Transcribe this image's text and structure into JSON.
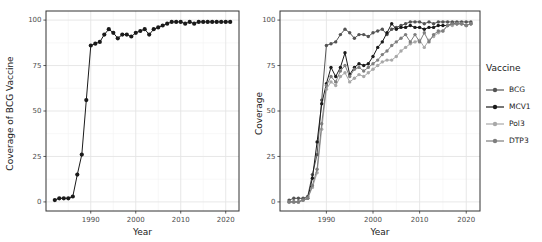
{
  "figure": {
    "background": "#ffffff",
    "panel_border": "#333333",
    "grid_major": "#e4e4e4",
    "grid_minor": "#f2f2f2",
    "axis_text_color": "#4d4d4d"
  },
  "legend": {
    "title": "Vaccine",
    "position": "right",
    "items": [
      {
        "label": "BCG",
        "color": "#545454"
      },
      {
        "label": "MCV1",
        "color": "#1a1a1a"
      },
      {
        "label": "Pol3",
        "color": "#a8a8a8"
      },
      {
        "label": "DTP3",
        "color": "#7e7e7e"
      }
    ]
  },
  "chart_data": [
    {
      "type": "line",
      "title": "",
      "xlabel": "Year",
      "ylabel": "Coverage of BCG Vaccine",
      "ylim": [
        0,
        100
      ],
      "xticks": [
        1990,
        2000,
        2010,
        2020
      ],
      "yticks": [
        0,
        25,
        50,
        75,
        100
      ],
      "grid": true,
      "x": [
        1982,
        1983,
        1984,
        1985,
        1986,
        1987,
        1988,
        1989,
        1990,
        1991,
        1992,
        1993,
        1994,
        1995,
        1996,
        1997,
        1998,
        1999,
        2000,
        2001,
        2002,
        2003,
        2004,
        2005,
        2006,
        2007,
        2008,
        2009,
        2010,
        2011,
        2012,
        2013,
        2014,
        2015,
        2016,
        2017,
        2018,
        2019,
        2020,
        2021
      ],
      "series": [
        {
          "name": "BCG",
          "color": "#1a1a1a",
          "values": [
            1,
            2,
            2,
            2,
            3,
            15,
            26,
            56,
            86,
            87,
            88,
            92,
            95,
            93,
            90,
            92,
            92,
            91,
            93,
            94,
            95,
            92,
            95,
            96,
            97,
            98,
            99,
            99,
            99,
            98,
            99,
            98,
            99,
            99,
            99,
            99,
            99,
            99,
            99,
            99
          ]
        }
      ]
    },
    {
      "type": "line",
      "title": "",
      "xlabel": "Year",
      "ylabel": "Coverage",
      "ylim": [
        0,
        100
      ],
      "xticks": [
        1990,
        2000,
        2010,
        2020
      ],
      "yticks": [
        0,
        25,
        50,
        75,
        100
      ],
      "grid": true,
      "legend_title": "Vaccine",
      "legend_position": "right",
      "x": [
        1982,
        1983,
        1984,
        1985,
        1986,
        1987,
        1988,
        1989,
        1990,
        1991,
        1992,
        1993,
        1994,
        1995,
        1996,
        1997,
        1998,
        1999,
        2000,
        2001,
        2002,
        2003,
        2004,
        2005,
        2006,
        2007,
        2008,
        2009,
        2010,
        2011,
        2012,
        2013,
        2014,
        2015,
        2016,
        2017,
        2018,
        2019,
        2020,
        2021
      ],
      "series": [
        {
          "name": "BCG",
          "color": "#545454",
          "values": [
            1,
            2,
            2,
            2,
            3,
            15,
            26,
            56,
            86,
            87,
            88,
            92,
            95,
            93,
            90,
            92,
            92,
            91,
            93,
            94,
            95,
            92,
            95,
            96,
            97,
            98,
            99,
            99,
            99,
            98,
            99,
            98,
            99,
            99,
            99,
            99,
            99,
            99,
            99,
            99
          ]
        },
        {
          "name": "MCV1",
          "color": "#1a1a1a",
          "values": [
            0,
            0,
            0,
            1,
            2,
            13,
            33,
            54,
            65,
            74,
            69,
            74,
            82,
            70,
            74,
            76,
            75,
            76,
            80,
            85,
            88,
            93,
            98,
            95,
            96,
            96,
            97,
            96,
            96,
            95,
            96,
            96,
            97,
            97,
            97,
            98,
            98,
            98,
            97,
            98
          ]
        },
        {
          "name": "Pol3",
          "color": "#a8a8a8",
          "values": [
            0,
            0,
            0,
            1,
            2,
            8,
            16,
            40,
            62,
            66,
            64,
            69,
            71,
            66,
            68,
            70,
            69,
            71,
            73,
            75,
            77,
            78,
            78,
            80,
            83,
            85,
            87,
            88,
            89,
            85,
            89,
            91,
            93,
            94,
            97,
            97,
            98,
            98,
            97,
            98
          ]
        },
        {
          "name": "DTP3",
          "color": "#7e7e7e",
          "values": [
            0,
            0,
            0,
            1,
            2,
            9,
            18,
            43,
            64,
            69,
            66,
            72,
            75,
            69,
            73,
            74,
            72,
            74,
            76,
            78,
            81,
            83,
            86,
            88,
            90,
            92,
            88,
            92,
            88,
            93,
            88,
            92,
            94,
            94,
            97,
            98,
            98,
            98,
            97,
            98
          ]
        }
      ]
    }
  ]
}
